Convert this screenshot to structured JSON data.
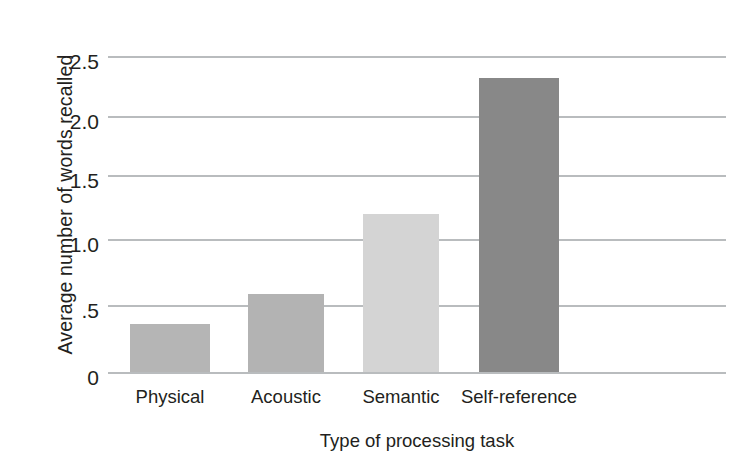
{
  "chart_data": {
    "type": "bar",
    "title": "",
    "categories": [
      "Physical",
      "Acoustic",
      "Semantic",
      "Self-reference"
    ],
    "values": [
      0.38,
      0.62,
      1.25,
      2.33
    ],
    "xlabel": "Type of processing task",
    "ylabel": "Average number of words recalled",
    "ylim": [
      0,
      2.5
    ],
    "yticks": [
      "0",
      ".5",
      "1.0",
      "1.5",
      "2.0",
      "2.5"
    ],
    "ytick_values": [
      0,
      0.5,
      1.0,
      1.5,
      2.0,
      2.5
    ],
    "grid": true,
    "legend": "none",
    "bar_colors": [
      "#b5b5b5",
      "#b3b3b3",
      "#d4d4d4",
      "#888888"
    ],
    "grid_color": "#b9bcbe",
    "text_color": "#231f20",
    "background": "#ffffff"
  }
}
